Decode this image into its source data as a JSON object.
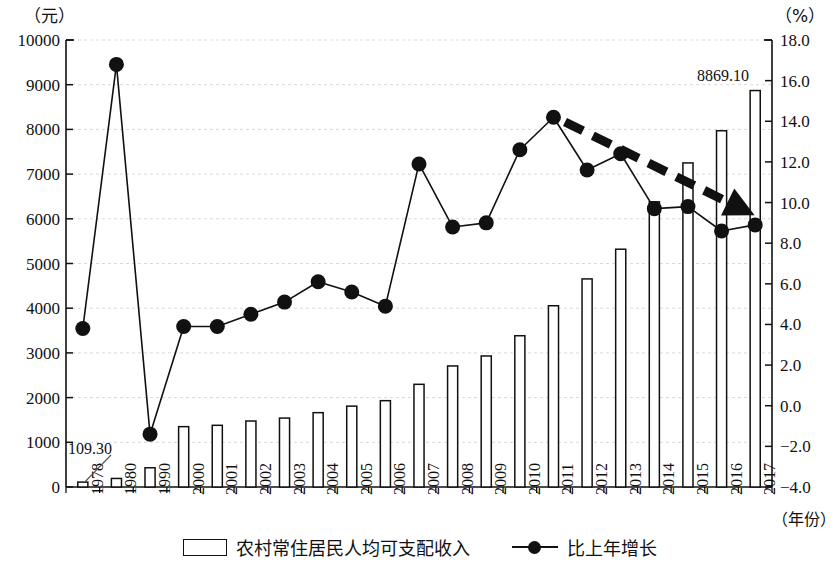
{
  "chart_data": {
    "type": "bar",
    "title": "",
    "subtitle": "",
    "xlabel": "（年份）",
    "ylabel": "（元）",
    "y2label": "（%）",
    "grid": true,
    "legend_position": "bottom",
    "categories": [
      "1978",
      "1980",
      "1990",
      "2000",
      "2001",
      "2002",
      "2003",
      "2004",
      "2005",
      "2006",
      "2007",
      "2008",
      "2009",
      "2010",
      "2011",
      "2012",
      "2013",
      "2014",
      "2015",
      "2016",
      "2017"
    ],
    "ylim": [
      0,
      10000
    ],
    "ytick_labels": [
      "0",
      "1000",
      "2000",
      "3000",
      "4000",
      "5000",
      "6000",
      "7000",
      "8000",
      "9000",
      "10000"
    ],
    "y2lim": [
      -4.0,
      18.0
    ],
    "y2tick_labels": [
      "-4.0",
      "-2.0",
      "0.0",
      "2.0",
      "4.0",
      "6.0",
      "8.0",
      "10.0",
      "12.0",
      "14.0",
      "16.0",
      "18.0"
    ],
    "series": [
      {
        "name": "农村常住居民人均可支配收入",
        "type": "bar",
        "axis": "left",
        "values": [
          109.3,
          191.3,
          430.0,
          1350.0,
          1380.0,
          1476.0,
          1542.0,
          1663.0,
          1809.0,
          1931.0,
          2297.0,
          2708.0,
          2931.0,
          3384.0,
          4055.0,
          4655.0,
          5320.0,
          6380.0,
          7250.0,
          7970.0,
          8869.1
        ]
      },
      {
        "name": "比上年增长",
        "type": "line",
        "axis": "right",
        "values": [
          3.8,
          16.8,
          -1.4,
          3.9,
          3.9,
          4.5,
          5.1,
          6.1,
          5.6,
          4.9,
          11.9,
          8.8,
          9.0,
          12.6,
          14.2,
          11.6,
          12.4,
          9.7,
          9.8,
          8.6,
          8.9
        ]
      }
    ],
    "annotations": [
      {
        "name": "first-bar-value",
        "text": "109.30",
        "target_category": "1978"
      },
      {
        "name": "last-bar-value",
        "text": "8869.10",
        "target_category": "2017"
      },
      {
        "name": "trend-arrow",
        "text": "",
        "description": "downward dashed trend arrow from 2011 to 2017"
      }
    ],
    "legend": [
      {
        "label": "农村常住居民人均可支配收入",
        "marker": "bar-outline"
      },
      {
        "label": "比上年增长",
        "marker": "line-dot"
      }
    ],
    "colors": {
      "bar_fill": "#ffffff",
      "bar_stroke": "#111111",
      "line": "#111111",
      "marker": "#111111",
      "grid": "#d9d9d9",
      "axis": "#111111",
      "trend_arrow": "#111111"
    }
  }
}
